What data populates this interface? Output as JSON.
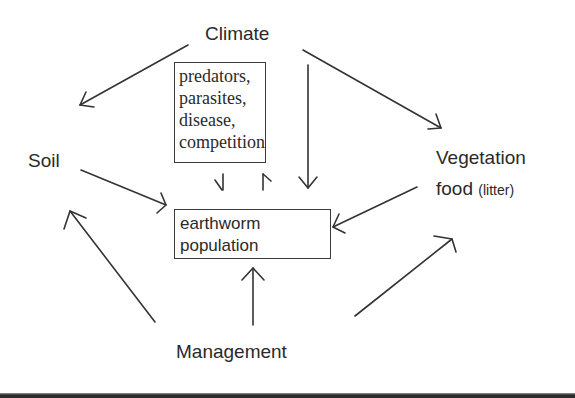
{
  "diagram": {
    "type": "influence-diagram",
    "nodes": {
      "climate": {
        "label": "Climate"
      },
      "soil": {
        "label": "Soil"
      },
      "vegetation": {
        "label_line1": "Vegetation",
        "label_line2": "food",
        "label_note": "(litter)"
      },
      "management": {
        "label": "Management"
      },
      "biotic_factors": {
        "lines": [
          "predators,",
          "parasites,",
          "disease,",
          "competition"
        ]
      },
      "earthworm_population": {
        "lines": [
          "earthworm",
          "population"
        ]
      }
    },
    "edges": [
      {
        "from": "Climate",
        "to": "Soil"
      },
      {
        "from": "Climate",
        "to": "Vegetation food (litter)"
      },
      {
        "from": "Climate",
        "to": "earthworm population"
      },
      {
        "from": "predators, parasites, disease, competition",
        "to": "earthworm population"
      },
      {
        "from": "earthworm population",
        "to": "predators, parasites, disease, competition"
      },
      {
        "from": "Soil",
        "to": "earthworm population"
      },
      {
        "from": "Vegetation food (litter)",
        "to": "earthworm population"
      },
      {
        "from": "Management",
        "to": "Soil"
      },
      {
        "from": "Management",
        "to": "earthworm population"
      },
      {
        "from": "Management",
        "to": "Vegetation food (litter)"
      }
    ],
    "colors": {
      "ink": "#2a2a2a",
      "background": "#ffffff",
      "bottom_bar": "#2c2c2c"
    }
  }
}
